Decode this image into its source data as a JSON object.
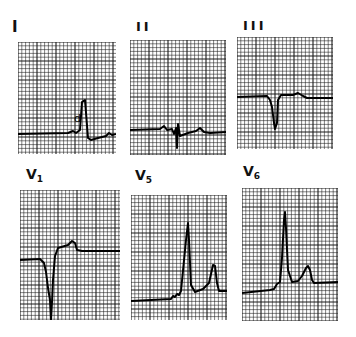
{
  "figure": {
    "annotation_mark": "d",
    "colors": {
      "grid": "#1a1a1a",
      "trace": "#000000",
      "background": "#ffffff"
    }
  },
  "leads": [
    {
      "id": "I",
      "label": "I",
      "sub": "",
      "x": 18,
      "y": 42,
      "w": 98,
      "h": 112,
      "labelX": 12,
      "labelY": 20,
      "labelSize": 15
    },
    {
      "id": "II",
      "label": "II",
      "sub": "",
      "x": 130,
      "y": 40,
      "w": 96,
      "h": 115,
      "labelX": 136,
      "labelY": 20,
      "labelSize": 13
    },
    {
      "id": "III",
      "label": "III",
      "sub": "",
      "x": 237,
      "y": 37,
      "w": 96,
      "h": 112,
      "labelX": 243,
      "labelY": 19,
      "labelSize": 13
    },
    {
      "id": "V1",
      "label": "V",
      "sub": "1",
      "x": 20,
      "y": 190,
      "w": 100,
      "h": 130,
      "labelX": 26,
      "labelY": 167,
      "labelSize": 14
    },
    {
      "id": "V5",
      "label": "V",
      "sub": "5",
      "x": 131,
      "y": 195,
      "w": 96,
      "h": 125,
      "labelX": 135,
      "labelY": 168,
      "labelSize": 14
    },
    {
      "id": "V6",
      "label": "V",
      "sub": "6",
      "x": 242,
      "y": 188,
      "w": 96,
      "h": 133,
      "labelX": 243,
      "labelY": 164,
      "labelSize": 14
    }
  ],
  "traces": {
    "I": "M0,92 L50,91 L55,89 L58,91 L62,88 L64,60 L67,58 L70,96 L73,98 L80,96 L88,94 L91,91 L94,93 L98,92",
    "II": "M0,90 L30,89 L34,86 L37,90 L42,89 L44,94 L46,88 L47,108 L48,84 L50,96 L58,93 L66,91 L70,88 L74,92 L80,93 L96,92",
    "III": "M0,60 L30,59 L33,63 L35,70 L37,86 L38,92 L40,86 L41,63 L44,58 L56,58 L61,56 L66,59 L70,61 L96,61",
    "V1": "M0,70 L20,69 L24,73 L26,82 L28,98 L30,110 L31,130 L32,112 L33,90 L35,66 L38,58 L48,55 L52,51 L55,53 L57,60 L62,61 L100,61",
    "V5": "M0,106 L40,104 L42,101 L44,102 L46,99 L48,100 L50,96 L55,45 L57,28 L58,45 L60,90 L64,97 L72,94 L78,88 L82,70 L84,71 L86,88 L88,96 L96,96",
    "V6": "M0,105 L28,102 L32,101 L35,96 L38,94 L40,70 L42,32 L43,24 L44,40 L46,82 L50,94 L56,93 L60,88 L64,80 L66,78 L68,82 L70,92 L72,95 L96,94"
  }
}
